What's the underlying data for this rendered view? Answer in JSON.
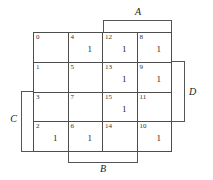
{
  "diagram": {
    "type": "karnaugh-map",
    "variables": [
      "A",
      "B",
      "C",
      "D"
    ],
    "rows": 4,
    "columns": 4,
    "cells": [
      {
        "index": "0",
        "value": ""
      },
      {
        "index": "4",
        "value": "1"
      },
      {
        "index": "12",
        "value": "1"
      },
      {
        "index": "8",
        "value": "1"
      },
      {
        "index": "1",
        "value": ""
      },
      {
        "index": "5",
        "value": ""
      },
      {
        "index": "13",
        "value": "1"
      },
      {
        "index": "9",
        "value": "1"
      },
      {
        "index": "3",
        "value": ""
      },
      {
        "index": "7",
        "value": ""
      },
      {
        "index": "15",
        "value": "1"
      },
      {
        "index": "11",
        "value": ""
      },
      {
        "index": "2",
        "value": "1"
      },
      {
        "index": "6",
        "value": "1"
      },
      {
        "index": "14",
        "value": ""
      },
      {
        "index": "10",
        "value": "1"
      }
    ],
    "brackets": [
      {
        "label": "A",
        "position": "top",
        "covers": "columns 3-4"
      },
      {
        "label": "B",
        "position": "bottom",
        "covers": "columns 2-3"
      },
      {
        "label": "C",
        "position": "left",
        "covers": "rows 3-4"
      },
      {
        "label": "D",
        "position": "right",
        "covers": "rows 2-3"
      }
    ],
    "colors": {
      "grid_line": "#4d4d4d",
      "bracket_line": "#555555",
      "text": "#262626",
      "background": "#ffffff"
    }
  }
}
